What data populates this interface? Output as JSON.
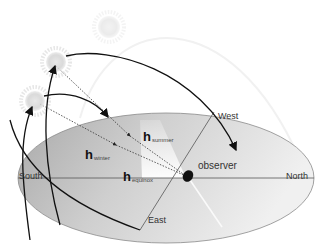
{
  "diagram": {
    "labels": {
      "west": "West",
      "east": "East",
      "south": "South",
      "north": "North",
      "observer": "observer"
    },
    "heights": {
      "summer": {
        "symbol": "h",
        "sub": "summer"
      },
      "winter": {
        "symbol": "h",
        "sub": "winter"
      },
      "equinox": {
        "symbol": "h",
        "sub": "equinox"
      }
    },
    "suns": [
      {
        "name": "summer-sun",
        "opacity": "faint"
      },
      {
        "name": "equinox-sun",
        "opacity": "medium"
      },
      {
        "name": "winter-sun",
        "opacity": "medium"
      }
    ],
    "colors": {
      "horizon_plane_dark": "#a8a8a8",
      "horizon_plane_light": "#ececec",
      "arc": "#111111",
      "sun": "#d8d8d8"
    }
  }
}
